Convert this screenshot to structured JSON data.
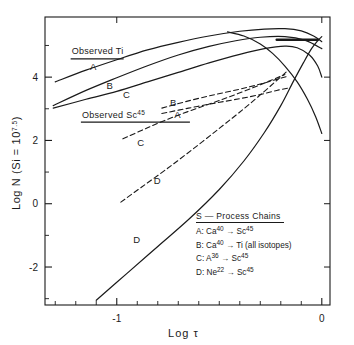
{
  "chart_data": {
    "type": "line",
    "title": "",
    "xlabel": "Log τ",
    "ylabel": "Log N (Si = 10^7.5)",
    "ylabel_main": "Log N (Si =",
    "ylabel_base": "10",
    "ylabel_exp": "7.5",
    "ylabel_close": ")",
    "xlim": [
      -1.35,
      0.04
    ],
    "ylim": [
      -3.2,
      5.9
    ],
    "xticks": [
      -1,
      0
    ],
    "xticklabels": [
      "-1",
      "0"
    ],
    "xminor": [
      -1.3,
      -1.2,
      -1.1,
      -0.9,
      -0.8,
      -0.7,
      -0.6,
      -0.5,
      -0.4,
      -0.3,
      -0.2,
      -0.1
    ],
    "yticks": [
      4,
      2,
      0,
      -2
    ],
    "yticklabels": [
      "4",
      "2",
      "0",
      "-2"
    ],
    "yminor": [
      5,
      3,
      1,
      -1,
      -3
    ],
    "grid": false,
    "legend_position": "inside-lower-right",
    "annotations": [
      {
        "name": "observed-ti",
        "text": "Observed  Ti",
        "x": -1.22,
        "y": 4.72,
        "underline": true
      },
      {
        "name": "observed-sc45",
        "text": "Observed  Sc",
        "sup": "45",
        "x": -1.17,
        "y": 2.72,
        "underline": true
      },
      {
        "name": "curve-label-solid-a",
        "text": "A",
        "x": -1.13,
        "y": 4.23
      },
      {
        "name": "curve-label-solid-b",
        "text": "B",
        "x": -1.05,
        "y": 3.62
      },
      {
        "name": "curve-label-solid-c",
        "text": "C",
        "x": -0.97,
        "y": 3.35
      },
      {
        "name": "curve-label-dashed-b",
        "text": "B",
        "x": -0.74,
        "y": 3.08
      },
      {
        "name": "curve-label-dashed-a",
        "text": "A",
        "x": -0.72,
        "y": 2.72
      },
      {
        "name": "curve-label-dashed-c",
        "text": "C",
        "x": -0.9,
        "y": 1.82
      },
      {
        "name": "curve-label-dashed-d",
        "text": "D",
        "x": -0.82,
        "y": 0.62
      },
      {
        "name": "curve-label-solid-d",
        "text": "D",
        "x": -0.92,
        "y": -1.25
      }
    ],
    "series": [
      {
        "name": "observed-ti-bar",
        "style": "solid-bar",
        "points": [
          [
            -0.22,
            5.18
          ],
          [
            -0.02,
            5.18
          ]
        ]
      },
      {
        "name": "solid-A",
        "style": "solid",
        "points": [
          [
            -1.3,
            3.85
          ],
          [
            -1.15,
            4.22
          ],
          [
            -1.0,
            4.55
          ],
          [
            -0.85,
            4.86
          ],
          [
            -0.7,
            5.1
          ],
          [
            -0.55,
            5.3
          ],
          [
            -0.4,
            5.45
          ],
          [
            -0.28,
            5.52
          ],
          [
            -0.18,
            5.53
          ],
          [
            -0.1,
            5.46
          ],
          [
            -0.04,
            5.3
          ],
          [
            0.0,
            5.12
          ]
        ]
      },
      {
        "name": "solid-B",
        "style": "solid",
        "points": [
          [
            -1.31,
            3.1
          ],
          [
            -1.15,
            3.58
          ],
          [
            -1.0,
            3.98
          ],
          [
            -0.85,
            4.36
          ],
          [
            -0.7,
            4.7
          ],
          [
            -0.55,
            4.97
          ],
          [
            -0.42,
            5.15
          ],
          [
            -0.3,
            5.26
          ],
          [
            -0.18,
            5.28
          ],
          [
            -0.08,
            5.16
          ],
          [
            0.0,
            4.9
          ]
        ]
      },
      {
        "name": "solid-C",
        "style": "solid",
        "points": [
          [
            -1.31,
            3.02
          ],
          [
            -1.15,
            3.3
          ],
          [
            -1.0,
            3.55
          ],
          [
            -0.85,
            3.85
          ],
          [
            -0.7,
            4.15
          ],
          [
            -0.55,
            4.45
          ],
          [
            -0.4,
            4.72
          ],
          [
            -0.28,
            4.9
          ],
          [
            -0.18,
            4.98
          ],
          [
            -0.12,
            4.93
          ],
          [
            -0.06,
            4.7
          ],
          [
            -0.02,
            4.35
          ],
          [
            0.0,
            4.0
          ]
        ]
      },
      {
        "name": "solid-descend-right",
        "style": "solid",
        "points": [
          [
            -0.46,
            5.43
          ],
          [
            -0.38,
            5.3
          ],
          [
            -0.3,
            5.05
          ],
          [
            -0.24,
            4.75
          ],
          [
            -0.18,
            4.35
          ],
          [
            -0.12,
            3.85
          ],
          [
            -0.07,
            3.3
          ],
          [
            -0.03,
            2.75
          ],
          [
            0.0,
            2.22
          ]
        ]
      },
      {
        "name": "solid-D",
        "style": "solid",
        "points": [
          [
            -1.1,
            -3.05
          ],
          [
            -0.95,
            -2.2
          ],
          [
            -0.8,
            -1.35
          ],
          [
            -0.65,
            -0.5
          ],
          [
            -0.5,
            0.45
          ],
          [
            -0.38,
            1.35
          ],
          [
            -0.28,
            2.25
          ],
          [
            -0.2,
            3.1
          ],
          [
            -0.14,
            3.85
          ],
          [
            -0.09,
            4.45
          ],
          [
            -0.05,
            4.9
          ],
          [
            -0.02,
            5.15
          ],
          [
            0.0,
            5.28
          ]
        ]
      },
      {
        "name": "dashed-B",
        "style": "dashed",
        "points": [
          [
            -0.78,
            3.02
          ],
          [
            -0.65,
            3.25
          ],
          [
            -0.52,
            3.45
          ],
          [
            -0.4,
            3.62
          ],
          [
            -0.3,
            3.78
          ],
          [
            -0.22,
            3.93
          ],
          [
            -0.17,
            4.02
          ]
        ]
      },
      {
        "name": "dashed-A",
        "style": "dashed",
        "points": [
          [
            -0.78,
            2.85
          ],
          [
            -0.65,
            3.02
          ],
          [
            -0.52,
            3.18
          ],
          [
            -0.4,
            3.32
          ],
          [
            -0.3,
            3.45
          ],
          [
            -0.22,
            3.58
          ],
          [
            -0.16,
            3.66
          ]
        ]
      },
      {
        "name": "dashed-C",
        "style": "dashed",
        "points": [
          [
            -0.97,
            2.05
          ],
          [
            -0.85,
            2.4
          ],
          [
            -0.72,
            2.75
          ],
          [
            -0.58,
            3.08
          ],
          [
            -0.45,
            3.38
          ],
          [
            -0.33,
            3.68
          ],
          [
            -0.24,
            3.92
          ],
          [
            -0.18,
            4.08
          ]
        ]
      },
      {
        "name": "dashed-D",
        "style": "dashed",
        "points": [
          [
            -0.98,
            0.05
          ],
          [
            -0.88,
            0.52
          ],
          [
            -0.76,
            1.08
          ],
          [
            -0.63,
            1.72
          ],
          [
            -0.5,
            2.38
          ],
          [
            -0.38,
            3.0
          ],
          [
            -0.28,
            3.55
          ],
          [
            -0.21,
            3.95
          ],
          [
            -0.17,
            4.18
          ]
        ]
      }
    ]
  },
  "legend": {
    "title": "S — Process  Chains",
    "entries": [
      {
        "key": "A:",
        "from": "Ca",
        "from_sup": "40",
        "arrow": "→",
        "to": "Sc",
        "to_sup": "45",
        "tail": ""
      },
      {
        "key": "B:",
        "from": "Ca",
        "from_sup": "40",
        "arrow": "→",
        "to": "Ti",
        "to_sup": "",
        "tail": " (all isotopes)"
      },
      {
        "key": "C:",
        "from": "A",
        "from_sup": "36",
        "arrow": "→",
        "to": "Sc",
        "to_sup": "45",
        "tail": ""
      },
      {
        "key": "D:",
        "from": "Ne",
        "from_sup": "22",
        "arrow": "→",
        "to": "Sc",
        "to_sup": "45",
        "tail": ""
      }
    ]
  },
  "colors": {
    "ink": "#1a1a1a",
    "background": "#ffffff"
  }
}
